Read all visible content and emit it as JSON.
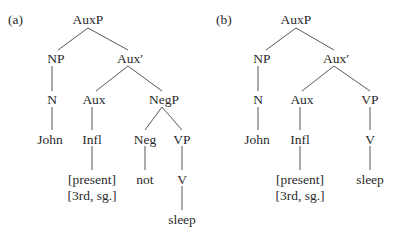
{
  "panels": [
    {
      "label": "(a)",
      "nodes": {
        "auxp": "AuxP",
        "np": "NP",
        "auxbar": "Aux′",
        "n": "N",
        "aux": "Aux",
        "negp": "NegP",
        "john": "John",
        "infl": "Infl",
        "neg": "Neg",
        "vp": "VP",
        "present": "[present]",
        "person_number": "[3rd, sg.]",
        "not": "not",
        "v": "V",
        "sleep": "sleep"
      }
    },
    {
      "label": "(b)",
      "nodes": {
        "auxp": "AuxP",
        "np": "NP",
        "auxbar": "Aux′",
        "n": "N",
        "aux": "Aux",
        "vp": "VP",
        "john": "John",
        "infl": "Infl",
        "v": "V",
        "present": "[present]",
        "person_number": "[3rd, sg.]",
        "sleep": "sleep"
      }
    }
  ]
}
